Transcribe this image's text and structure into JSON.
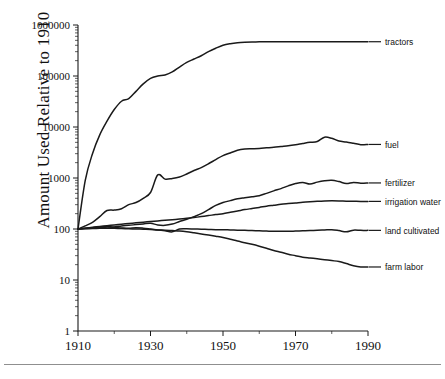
{
  "chart_data": {
    "type": "line",
    "title": "",
    "xlabel": "",
    "ylabel": "Amount Used Relative to 1910",
    "xlim": [
      1910,
      1990
    ],
    "ylim": [
      1,
      1000000
    ],
    "yscale": "log",
    "grid": false,
    "legend_position": "right-inline",
    "xticks": [
      1910,
      1930,
      1950,
      1970,
      1990
    ],
    "xtick_labels": [
      "1910",
      "1930",
      "1950",
      "1970",
      "1990"
    ],
    "xminor_ticks": [
      1920,
      1940,
      1960,
      1980
    ],
    "yticks": [
      1,
      10,
      100,
      1000,
      10000,
      100000,
      1000000
    ],
    "ytick_labels": [
      "1",
      "10",
      "100",
      "1000",
      "10000",
      "100000",
      "1000000"
    ],
    "x": [
      1910,
      1912,
      1914,
      1916,
      1918,
      1920,
      1922,
      1924,
      1926,
      1928,
      1930,
      1932,
      1934,
      1936,
      1938,
      1940,
      1942,
      1944,
      1946,
      1948,
      1950,
      1952,
      1954,
      1956,
      1958,
      1960,
      1962,
      1964,
      1966,
      1968,
      1970,
      1972,
      1974,
      1976,
      1978,
      1980,
      1982,
      1984,
      1986,
      1988,
      1990
    ],
    "series": [
      {
        "name": "tractors",
        "label": "tractors",
        "values": [
          100,
          900,
          3000,
          7000,
          13000,
          22000,
          32000,
          36000,
          50000,
          70000,
          90000,
          100000,
          105000,
          120000,
          150000,
          185000,
          215000,
          250000,
          300000,
          350000,
          400000,
          430000,
          450000,
          460000,
          465000,
          468000,
          470000,
          470000,
          470000,
          470000,
          470000,
          470000,
          470000,
          470000,
          470000,
          470000,
          470000,
          470000,
          470000,
          470000,
          470000
        ]
      },
      {
        "name": "fuel",
        "label": "fuel",
        "values": [
          100,
          115,
          135,
          175,
          230,
          235,
          250,
          300,
          330,
          400,
          520,
          1150,
          950,
          980,
          1050,
          1200,
          1400,
          1600,
          1900,
          2300,
          2750,
          3100,
          3500,
          3700,
          3750,
          3800,
          3900,
          4000,
          4150,
          4300,
          4500,
          4750,
          5000,
          5200,
          6300,
          6000,
          5300,
          5100,
          4800,
          4500,
          4550
        ]
      },
      {
        "name": "fertilizer",
        "label": "fertilizer",
        "values": [
          100,
          103,
          106,
          110,
          112,
          110,
          115,
          118,
          122,
          126,
          130,
          120,
          118,
          125,
          140,
          155,
          175,
          200,
          240,
          290,
          330,
          360,
          390,
          410,
          430,
          450,
          500,
          560,
          620,
          700,
          780,
          820,
          760,
          830,
          880,
          900,
          850,
          780,
          820,
          790,
          800
        ]
      },
      {
        "name": "irrigation water",
        "label": "irrigation water",
        "values": [
          100,
          104,
          108,
          112,
          116,
          120,
          124,
          128,
          132,
          136,
          140,
          144,
          148,
          152,
          157,
          162,
          168,
          175,
          183,
          192,
          200,
          212,
          225,
          240,
          252,
          265,
          280,
          292,
          305,
          315,
          325,
          335,
          343,
          350,
          355,
          358,
          356,
          352,
          350,
          348,
          348
        ]
      },
      {
        "name": "land cultivated",
        "label": "land cultivated",
        "values": [
          100,
          102,
          104,
          106,
          110,
          108,
          105,
          103,
          106,
          104,
          100,
          96,
          92,
          88,
          100,
          101,
          100,
          99,
          98,
          97,
          97,
          96,
          95,
          94,
          93,
          92,
          91,
          90,
          90,
          90,
          91,
          92,
          93,
          95,
          96,
          97,
          93,
          88,
          95,
          94,
          94
        ]
      },
      {
        "name": "farm labor",
        "label": "farm labor",
        "values": [
          100,
          101,
          102,
          103,
          104,
          103,
          102,
          101,
          100,
          99,
          98,
          96,
          95,
          93,
          91,
          88,
          84,
          80,
          76,
          72,
          68,
          63,
          58,
          54,
          50,
          46,
          42,
          38,
          35,
          32,
          30,
          28,
          27,
          26,
          25,
          24,
          23,
          21,
          19,
          18,
          18
        ]
      }
    ],
    "series_label_positions": [
      {
        "name": "tractors",
        "value": 470000
      },
      {
        "name": "fuel",
        "value": 4550
      },
      {
        "name": "fertilizer",
        "value": 800
      },
      {
        "name": "irrigation water",
        "value": 348
      },
      {
        "name": "land cultivated",
        "value": 94
      },
      {
        "name": "farm labor",
        "value": 18
      }
    ]
  }
}
